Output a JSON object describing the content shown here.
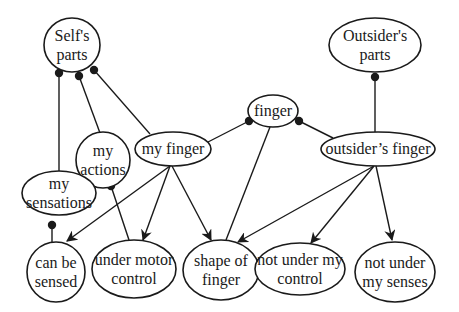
{
  "diagram": {
    "type": "semantic network",
    "background": "#ffffff",
    "line_color": "#1a1a1a",
    "nodes": [
      {
        "id": "self_parts",
        "lines": [
          "Self's",
          "parts"
        ],
        "cx": 72,
        "cy": 45,
        "rx": 28,
        "ry": 27
      },
      {
        "id": "outsider_parts",
        "lines": [
          "Outsider's",
          "parts"
        ],
        "cx": 375,
        "cy": 45,
        "rx": 46,
        "ry": 27
      },
      {
        "id": "finger",
        "lines": [
          "finger"
        ],
        "cx": 273,
        "cy": 111,
        "rx": 25,
        "ry": 16
      },
      {
        "id": "my_finger",
        "lines": [
          "my finger"
        ],
        "cx": 173,
        "cy": 149,
        "rx": 38,
        "ry": 17
      },
      {
        "id": "outsider_finger",
        "lines": [
          "outsider’s finger"
        ],
        "cx": 378,
        "cy": 149,
        "rx": 57,
        "ry": 17
      },
      {
        "id": "my_actions",
        "lines": [
          "my",
          "actions"
        ],
        "cx": 103,
        "cy": 160,
        "rx": 27,
        "ry": 28
      },
      {
        "id": "my_sensations",
        "lines": [
          "my",
          "sensations"
        ],
        "cx": 59,
        "cy": 193,
        "rx": 37,
        "ry": 22
      },
      {
        "id": "can_be_sensed",
        "lines": [
          "can be",
          "sensed"
        ],
        "cx": 56,
        "cy": 272,
        "rx": 29,
        "ry": 30
      },
      {
        "id": "under_motor_control",
        "lines": [
          "under motor",
          "control"
        ],
        "cx": 134,
        "cy": 269,
        "rx": 42,
        "ry": 29
      },
      {
        "id": "shape_of_finger",
        "lines": [
          "shape of",
          "finger"
        ],
        "cx": 221,
        "cy": 270,
        "rx": 38,
        "ry": 30
      },
      {
        "id": "not_under_my_control",
        "lines": [
          "not under my",
          "control"
        ],
        "cx": 300,
        "cy": 269,
        "rx": 45,
        "ry": 26
      },
      {
        "id": "not_under_my_senses",
        "lines": [
          "not under",
          "my senses"
        ],
        "cx": 395,
        "cy": 272,
        "rx": 40,
        "ry": 30
      }
    ],
    "edges": [
      {
        "from": "my_sensations",
        "to": "self_parts",
        "style": "dot-end",
        "x1": 59,
        "y1": 171,
        "x2": 59,
        "y2": 73
      },
      {
        "from": "my_actions",
        "to": "self_parts",
        "style": "dot-end",
        "x1": 100,
        "y1": 133,
        "x2": 79,
        "y2": 76
      },
      {
        "from": "my_finger",
        "to": "self_parts",
        "style": "dot-end",
        "x1": 150,
        "y1": 134,
        "x2": 94,
        "y2": 70
      },
      {
        "from": "my_finger",
        "to": "finger",
        "style": "dot-end",
        "x1": 208,
        "y1": 142,
        "x2": 249,
        "y2": 121
      },
      {
        "from": "outsider_finger",
        "to": "finger",
        "style": "dot-end",
        "x1": 333,
        "y1": 138,
        "x2": 299,
        "y2": 121
      },
      {
        "from": "outsider_finger",
        "to": "outsider_parts",
        "style": "dot-end",
        "x1": 375,
        "y1": 132,
        "x2": 375,
        "y2": 77
      },
      {
        "from": "can_be_sensed",
        "to": "my_sensations",
        "style": "dot-end",
        "x1": 52,
        "y1": 242,
        "x2": 52,
        "y2": 225
      },
      {
        "from": "under_motor_control",
        "to": "my_actions",
        "style": "dot-end",
        "x1": 129,
        "y1": 240,
        "x2": 111,
        "y2": 186
      },
      {
        "from": "finger",
        "to": "shape_of_finger",
        "style": "line",
        "x1": 270,
        "y1": 127,
        "x2": 226,
        "y2": 240
      },
      {
        "from": "my_finger",
        "to": "can_be_sensed",
        "style": "arrow",
        "x1": 170,
        "y1": 166,
        "x2": 67,
        "y2": 241
      },
      {
        "from": "my_finger",
        "to": "under_motor_control",
        "style": "arrow",
        "x1": 170,
        "y1": 166,
        "x2": 143,
        "y2": 240
      },
      {
        "from": "my_finger",
        "to": "shape_of_finger",
        "style": "arrow",
        "x1": 172,
        "y1": 166,
        "x2": 211,
        "y2": 240
      },
      {
        "from": "outsider_finger",
        "to": "shape_of_finger",
        "style": "arrow",
        "x1": 374,
        "y1": 166,
        "x2": 238,
        "y2": 242
      },
      {
        "from": "outsider_finger",
        "to": "not_under_my_control",
        "style": "arrow",
        "x1": 374,
        "y1": 166,
        "x2": 311,
        "y2": 243
      },
      {
        "from": "outsider_finger",
        "to": "not_under_my_senses",
        "style": "arrow",
        "x1": 376,
        "y1": 166,
        "x2": 392,
        "y2": 240
      }
    ]
  }
}
